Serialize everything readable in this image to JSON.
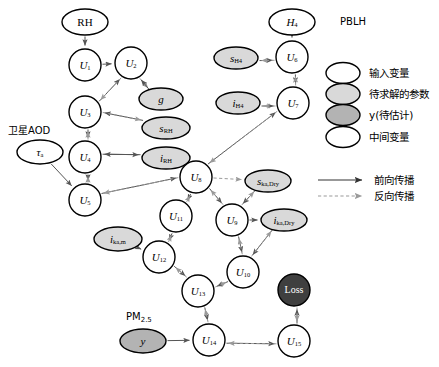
{
  "figure": {
    "colors": {
      "node_fill_white": "#ffffff",
      "node_fill_param": "#d9d9d9",
      "node_fill_target": "#b3b3b3",
      "node_fill_loss": "#3f3f3f",
      "stroke": "#000000",
      "forward_edge": "#555555",
      "backward_edge": "#9a9a9a",
      "background": "#ffffff"
    },
    "external_labels": [
      {
        "name": "pblh-label",
        "text": "PBLH",
        "x": 340,
        "y": 22,
        "anchor": "start",
        "size": 10
      },
      {
        "name": "satellite-aod-label",
        "text": "卫星AOD",
        "x": 8,
        "y": 131,
        "anchor": "start",
        "size": 10
      },
      {
        "name": "pm25-label",
        "text": "PM",
        "sub": "2.5",
        "x": 126,
        "y": 317,
        "anchor": "start",
        "size": 10
      }
    ],
    "nodes": [
      {
        "name": "node-rh",
        "label": "RH",
        "sub": "",
        "italic": false,
        "shape": "ellipse",
        "kind": "input",
        "cx": 85,
        "cy": 22,
        "rx": 23,
        "ry": 13
      },
      {
        "name": "node-u1",
        "label": "U",
        "sub": "1",
        "italic": true,
        "shape": "circle",
        "kind": "intermediate",
        "cx": 85,
        "cy": 65,
        "rx": 16,
        "ry": 16
      },
      {
        "name": "node-u2",
        "label": "U",
        "sub": "2",
        "italic": true,
        "shape": "circle",
        "kind": "intermediate",
        "cx": 131,
        "cy": 63,
        "rx": 16,
        "ry": 16
      },
      {
        "name": "node-g",
        "label": "g",
        "sub": "",
        "italic": true,
        "shape": "ellipse",
        "kind": "parameter",
        "cx": 161,
        "cy": 99,
        "rx": 22,
        "ry": 11
      },
      {
        "name": "node-u3",
        "label": "U",
        "sub": "3",
        "italic": true,
        "shape": "circle",
        "kind": "intermediate",
        "cx": 85,
        "cy": 112,
        "rx": 16,
        "ry": 16
      },
      {
        "name": "node-srh",
        "label": "s",
        "sub": "RH",
        "italic": true,
        "shape": "ellipse",
        "kind": "parameter",
        "cx": 166,
        "cy": 128,
        "rx": 24,
        "ry": 11
      },
      {
        "name": "node-tau",
        "label": "τ",
        "sub": "a",
        "italic": true,
        "shape": "ellipse",
        "kind": "input",
        "cx": 40,
        "cy": 152,
        "rx": 23,
        "ry": 12
      },
      {
        "name": "node-u4",
        "label": "U",
        "sub": "4",
        "italic": true,
        "shape": "circle",
        "kind": "intermediate",
        "cx": 85,
        "cy": 157,
        "rx": 16,
        "ry": 16
      },
      {
        "name": "node-irh",
        "label": "i",
        "sub": "RH",
        "italic": true,
        "shape": "ellipse",
        "kind": "parameter",
        "cx": 166,
        "cy": 158,
        "rx": 24,
        "ry": 11
      },
      {
        "name": "node-u5",
        "label": "U",
        "sub": "5",
        "italic": true,
        "shape": "circle",
        "kind": "intermediate",
        "cx": 85,
        "cy": 200,
        "rx": 16,
        "ry": 16
      },
      {
        "name": "node-h4",
        "label": "H",
        "sub": "4",
        "italic": true,
        "shape": "ellipse",
        "kind": "input",
        "cx": 292,
        "cy": 22,
        "rx": 23,
        "ry": 13
      },
      {
        "name": "node-u6",
        "label": "U",
        "sub": "6",
        "italic": true,
        "shape": "circle",
        "kind": "intermediate",
        "cx": 292,
        "cy": 57,
        "rx": 16,
        "ry": 16
      },
      {
        "name": "node-sh4",
        "label": "s",
        "sub": "H4",
        "italic": true,
        "shape": "ellipse",
        "kind": "parameter",
        "cx": 236,
        "cy": 58,
        "rx": 22,
        "ry": 11
      },
      {
        "name": "node-u7",
        "label": "U",
        "sub": "7",
        "italic": true,
        "shape": "circle",
        "kind": "intermediate",
        "cx": 293,
        "cy": 103,
        "rx": 16,
        "ry": 16
      },
      {
        "name": "node-ih4",
        "label": "i",
        "sub": "H4",
        "italic": true,
        "shape": "ellipse",
        "kind": "parameter",
        "cx": 238,
        "cy": 103,
        "rx": 22,
        "ry": 11
      },
      {
        "name": "node-u8",
        "label": "U",
        "sub": "8",
        "italic": true,
        "shape": "circle",
        "kind": "intermediate",
        "cx": 196,
        "cy": 177,
        "rx": 16,
        "ry": 16
      },
      {
        "name": "node-skadry",
        "label": "s",
        "sub": "ka,Dry",
        "italic": true,
        "shape": "ellipse",
        "kind": "parameter",
        "cx": 268,
        "cy": 181,
        "rx": 23,
        "ry": 11
      },
      {
        "name": "node-u11",
        "label": "U",
        "sub": "11",
        "italic": true,
        "shape": "circle",
        "kind": "intermediate",
        "cx": 176,
        "cy": 216,
        "rx": 16,
        "ry": 16
      },
      {
        "name": "node-u9",
        "label": "U",
        "sub": "9",
        "italic": true,
        "shape": "circle",
        "kind": "intermediate",
        "cx": 232,
        "cy": 220,
        "rx": 16,
        "ry": 16
      },
      {
        "name": "node-ikadry",
        "label": "i",
        "sub": "ka,Dry",
        "italic": true,
        "shape": "ellipse",
        "kind": "parameter",
        "cx": 284,
        "cy": 220,
        "rx": 23,
        "ry": 11
      },
      {
        "name": "node-ikaam",
        "label": "i",
        "sub": "ka,m",
        "italic": true,
        "shape": "ellipse",
        "kind": "parameter",
        "cx": 118,
        "cy": 239,
        "rx": 24,
        "ry": 12
      },
      {
        "name": "node-u12",
        "label": "U",
        "sub": "12",
        "italic": true,
        "shape": "circle",
        "kind": "intermediate",
        "cx": 159,
        "cy": 257,
        "rx": 16,
        "ry": 16
      },
      {
        "name": "node-u10",
        "label": "U",
        "sub": "10",
        "italic": true,
        "shape": "circle",
        "kind": "intermediate",
        "cx": 243,
        "cy": 272,
        "rx": 16,
        "ry": 16
      },
      {
        "name": "node-u13",
        "label": "U",
        "sub": "13",
        "italic": true,
        "shape": "circle",
        "kind": "intermediate",
        "cx": 198,
        "cy": 291,
        "rx": 16,
        "ry": 16
      },
      {
        "name": "node-loss",
        "label": "Loss",
        "sub": "",
        "italic": false,
        "shape": "circle",
        "kind": "loss",
        "cx": 294,
        "cy": 290,
        "rx": 16,
        "ry": 16
      },
      {
        "name": "node-y",
        "label": "y",
        "sub": "",
        "italic": true,
        "shape": "ellipse",
        "kind": "target",
        "cx": 143,
        "cy": 341,
        "rx": 23,
        "ry": 12
      },
      {
        "name": "node-u14",
        "label": "U",
        "sub": "14",
        "italic": true,
        "shape": "circle",
        "kind": "intermediate",
        "cx": 209,
        "cy": 340,
        "rx": 16,
        "ry": 16
      },
      {
        "name": "node-u15",
        "label": "U",
        "sub": "15",
        "italic": true,
        "shape": "circle",
        "kind": "intermediate",
        "cx": 294,
        "cy": 341,
        "rx": 16,
        "ry": 16
      }
    ],
    "edges": [
      {
        "name": "edge-rh-u1",
        "from": "node-rh",
        "to": "node-u1",
        "dir": "forward",
        "offset": 0
      },
      {
        "name": "edge-u1-u2",
        "from": "node-u1",
        "to": "node-u2",
        "dir": "forward",
        "offset": 0
      },
      {
        "name": "edge-u2-u3-fwd",
        "from": "node-u3",
        "to": "node-u2",
        "dir": "forward",
        "offset": 3
      },
      {
        "name": "edge-u2-u3-bwd",
        "from": "node-u2",
        "to": "node-u3",
        "dir": "backward",
        "offset": -3
      },
      {
        "name": "edge-u2-g-fwd",
        "from": "node-u2",
        "to": "node-g",
        "dir": "backward",
        "offset": 3
      },
      {
        "name": "edge-g-u2-bwd",
        "from": "node-g",
        "to": "node-u2",
        "dir": "forward",
        "offset": -3
      },
      {
        "name": "edge-srh-u3-fwd",
        "from": "node-srh",
        "to": "node-u3",
        "dir": "forward",
        "offset": 3
      },
      {
        "name": "edge-u3-srh-bwd",
        "from": "node-u3",
        "to": "node-srh",
        "dir": "backward",
        "offset": -3
      },
      {
        "name": "edge-u3-u4-fwd",
        "from": "node-u3",
        "to": "node-u4",
        "dir": "forward",
        "offset": -3
      },
      {
        "name": "edge-u4-u3-bwd",
        "from": "node-u4",
        "to": "node-u3",
        "dir": "backward",
        "offset": 3
      },
      {
        "name": "edge-irh-u4-fwd",
        "from": "node-irh",
        "to": "node-u4",
        "dir": "forward",
        "offset": 3
      },
      {
        "name": "edge-u4-irh-bwd",
        "from": "node-u4",
        "to": "node-irh",
        "dir": "forward",
        "offset": -3
      },
      {
        "name": "edge-tau-u5",
        "from": "node-tau",
        "to": "node-u5",
        "dir": "forward",
        "offset": 0
      },
      {
        "name": "edge-u4-u5-fwd",
        "from": "node-u4",
        "to": "node-u5",
        "dir": "forward",
        "offset": -3
      },
      {
        "name": "edge-u5-u4-bwd",
        "from": "node-u5",
        "to": "node-u4",
        "dir": "backward",
        "offset": 3
      },
      {
        "name": "edge-u5-u8-fwd",
        "from": "node-u5",
        "to": "node-u8",
        "dir": "forward",
        "offset": -3
      },
      {
        "name": "edge-u8-u5-bwd",
        "from": "node-u8",
        "to": "node-u5",
        "dir": "backward",
        "offset": 3
      },
      {
        "name": "edge-h4-u6",
        "from": "node-h4",
        "to": "node-u6",
        "dir": "forward",
        "offset": 0
      },
      {
        "name": "edge-sh4-u6-fwd",
        "from": "node-sh4",
        "to": "node-u6",
        "dir": "forward",
        "offset": 3
      },
      {
        "name": "edge-u6-sh4-bwd",
        "from": "node-u6",
        "to": "node-sh4",
        "dir": "backward",
        "offset": -3
      },
      {
        "name": "edge-u6-u7-fwd",
        "from": "node-u6",
        "to": "node-u7",
        "dir": "forward",
        "offset": -3
      },
      {
        "name": "edge-u7-u6-bwd",
        "from": "node-u7",
        "to": "node-u6",
        "dir": "backward",
        "offset": 3
      },
      {
        "name": "edge-ih4-u7-fwd",
        "from": "node-ih4",
        "to": "node-u7",
        "dir": "forward",
        "offset": 3
      },
      {
        "name": "edge-u7-ih4-bwd",
        "from": "node-u7",
        "to": "node-ih4",
        "dir": "backward",
        "offset": -3
      },
      {
        "name": "edge-u8-u7-fwd",
        "from": "node-u8",
        "to": "node-u7",
        "dir": "forward",
        "offset": -3
      },
      {
        "name": "edge-u7-u8-bwd",
        "from": "node-u7",
        "to": "node-u8",
        "dir": "backward",
        "offset": 3
      },
      {
        "name": "edge-u8-u11-fwd",
        "from": "node-u8",
        "to": "node-u11",
        "dir": "forward",
        "offset": -3
      },
      {
        "name": "edge-u11-u8-bwd",
        "from": "node-u11",
        "to": "node-u8",
        "dir": "backward",
        "offset": 3
      },
      {
        "name": "edge-u8-u9-fwd",
        "from": "node-u8",
        "to": "node-u9",
        "dir": "forward",
        "offset": -3
      },
      {
        "name": "edge-u9-u8-bwd",
        "from": "node-u9",
        "to": "node-u8",
        "dir": "backward",
        "offset": 3
      },
      {
        "name": "edge-ska-u9-fwd",
        "from": "node-skadry",
        "to": "node-u9",
        "dir": "forward",
        "offset": 3
      },
      {
        "name": "edge-u9-ska-bwd",
        "from": "node-u9",
        "to": "node-skadry",
        "dir": "backward",
        "offset": -3
      },
      {
        "name": "edge-u8-ska-bwd",
        "from": "node-u8",
        "to": "node-skadry",
        "dir": "backward",
        "offset": 0
      },
      {
        "name": "edge-u9-u10-fwd",
        "from": "node-u9",
        "to": "node-u10",
        "dir": "forward",
        "offset": -3
      },
      {
        "name": "edge-u10-u9-bwd",
        "from": "node-u10",
        "to": "node-u9",
        "dir": "backward",
        "offset": 3
      },
      {
        "name": "edge-ika-u10-fwd",
        "from": "node-ikadry",
        "to": "node-u10",
        "dir": "forward",
        "offset": 3
      },
      {
        "name": "edge-u10-ika-bwd",
        "from": "node-u10",
        "to": "node-ikadry",
        "dir": "backward",
        "offset": -3
      },
      {
        "name": "edge-u9-ika-fwd",
        "from": "node-u9",
        "to": "node-ikadry",
        "dir": "forward",
        "offset": 0
      },
      {
        "name": "edge-u11-u12-fwd",
        "from": "node-u11",
        "to": "node-u12",
        "dir": "forward",
        "offset": -3
      },
      {
        "name": "edge-u12-u11-bwd",
        "from": "node-u12",
        "to": "node-u11",
        "dir": "backward",
        "offset": 3
      },
      {
        "name": "edge-ikam-u12",
        "from": "node-ikaam",
        "to": "node-u12",
        "dir": "forward",
        "offset": 0
      },
      {
        "name": "edge-u12-u13-fwd",
        "from": "node-u12",
        "to": "node-u13",
        "dir": "forward",
        "offset": -3
      },
      {
        "name": "edge-u13-u12-bwd",
        "from": "node-u13",
        "to": "node-u12",
        "dir": "backward",
        "offset": 3
      },
      {
        "name": "edge-u10-u13-fwd",
        "from": "node-u10",
        "to": "node-u13",
        "dir": "forward",
        "offset": -3
      },
      {
        "name": "edge-u13-u10-bwd",
        "from": "node-u13",
        "to": "node-u10",
        "dir": "backward",
        "offset": 3
      },
      {
        "name": "edge-u13-u14-fwd",
        "from": "node-u13",
        "to": "node-u14",
        "dir": "forward",
        "offset": -3
      },
      {
        "name": "edge-u14-u13-bwd",
        "from": "node-u14",
        "to": "node-u13",
        "dir": "backward",
        "offset": 3
      },
      {
        "name": "edge-y-u14",
        "from": "node-y",
        "to": "node-u14",
        "dir": "forward",
        "offset": 0
      },
      {
        "name": "edge-u14-u15-fwd",
        "from": "node-u14",
        "to": "node-u15",
        "dir": "forward",
        "offset": 3
      },
      {
        "name": "edge-u15-u14-bwd",
        "from": "node-u15",
        "to": "node-u14",
        "dir": "backward",
        "offset": -3
      },
      {
        "name": "edge-u15-loss-fwd",
        "from": "node-u15",
        "to": "node-loss",
        "dir": "forward",
        "offset": 3
      },
      {
        "name": "edge-loss-u15-bwd",
        "from": "node-loss",
        "to": "node-u15",
        "dir": "backward",
        "offset": -3
      }
    ],
    "legend": {
      "items": [
        {
          "name": "legend-input-variable",
          "text": "输入变量",
          "kind": "input",
          "cx": 343,
          "cy": 73
        },
        {
          "name": "legend-solved-parameter",
          "text": "待求解的参数",
          "kind": "parameter",
          "cx": 343,
          "cy": 94
        },
        {
          "name": "legend-target-estimate",
          "text": "y(待估计)",
          "kind": "target",
          "cx": 343,
          "cy": 115
        },
        {
          "name": "legend-intermediate",
          "text": "中间变量",
          "kind": "input",
          "cx": 343,
          "cy": 137
        }
      ],
      "arrows": [
        {
          "name": "legend-forward-propagation",
          "text": "前向传播",
          "dir": "forward",
          "x1": 318,
          "x2": 362,
          "y": 180
        },
        {
          "name": "legend-backward-propagation",
          "text": "反向传播",
          "dir": "backward",
          "x1": 318,
          "x2": 362,
          "y": 196
        }
      ]
    }
  }
}
